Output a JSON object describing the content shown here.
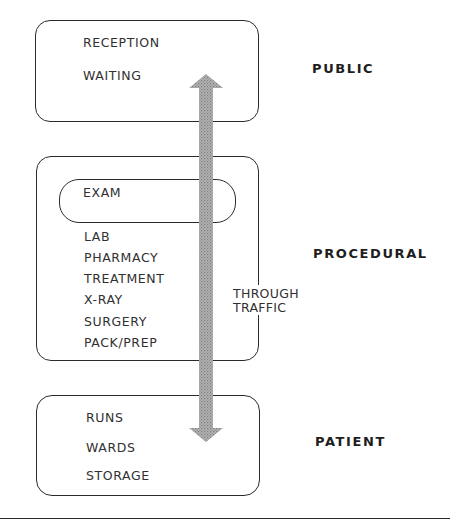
{
  "diagram": {
    "zones": [
      {
        "id": "public",
        "label": "PUBLIC",
        "rooms": [
          "RECEPTION",
          "WAITING"
        ]
      },
      {
        "id": "procedural",
        "label": "PROCEDURAL",
        "highlighted_room": "EXAM",
        "rooms": [
          "LAB",
          "PHARMACY",
          "TREATMENT",
          "X-RAY",
          "SURGERY",
          "PACK/PREP"
        ]
      },
      {
        "id": "patient",
        "label": "PATIENT",
        "rooms": [
          "RUNS",
          "WARDS",
          "STORAGE"
        ]
      }
    ],
    "circulation": {
      "label_line1": "THROUGH",
      "label_line2": "TRAFFIC",
      "arrow_icon": "double-headed-vertical-arrow",
      "arrow_fill": "#9a9a9a"
    },
    "colors": {
      "line": "#2b2b2b",
      "text": "#303030",
      "background": "#ffffff"
    }
  }
}
